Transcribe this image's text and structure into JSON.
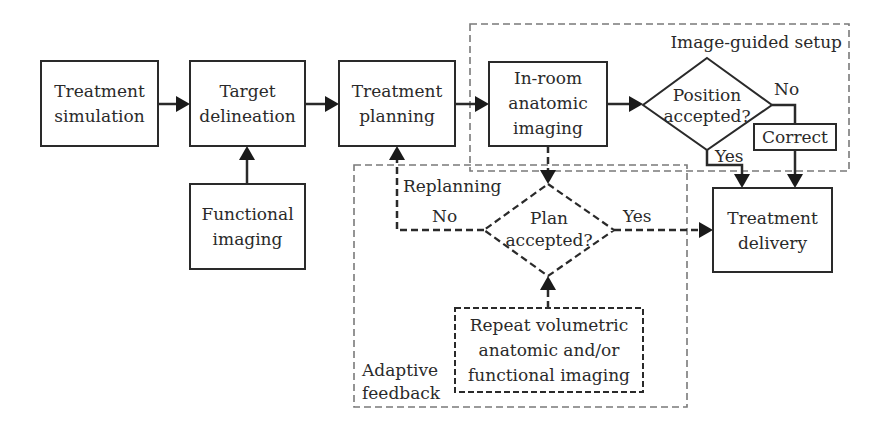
{
  "diagram": {
    "type": "flowchart",
    "nodes": {
      "treatment_simulation": {
        "line1": "Treatment",
        "line2": "simulation"
      },
      "target_delineation": {
        "line1": "Target",
        "line2": "delineation"
      },
      "functional_imaging": {
        "line1": "Functional",
        "line2": "imaging"
      },
      "treatment_planning": {
        "line1": "Treatment",
        "line2": "planning"
      },
      "inroom_imaging": {
        "line1": "In-room",
        "line2": "anatomic",
        "line3": "imaging"
      },
      "position_decision": {
        "line1": "Position",
        "line2": "accepted?"
      },
      "correct": {
        "label": "Correct"
      },
      "treatment_delivery": {
        "line1": "Treatment",
        "line2": "delivery"
      },
      "plan_decision": {
        "line1": "Plan",
        "line2": "accepted?"
      },
      "repeat_imaging": {
        "line1": "Repeat volumetric",
        "line2": "anatomic and/or",
        "line3": "functional imaging"
      }
    },
    "groups": {
      "image_guided_setup": {
        "label": "Image-guided setup"
      },
      "adaptive_feedback": {
        "line1": "Adaptive",
        "line2": "feedback"
      }
    },
    "edge_labels": {
      "position_no": "No",
      "position_yes": "Yes",
      "plan_no": "No",
      "plan_yes": "Yes",
      "replanning": "Replanning"
    },
    "edges": [
      {
        "from": "Treatment simulation",
        "to": "Target delineation",
        "style": "solid"
      },
      {
        "from": "Functional imaging",
        "to": "Target delineation",
        "style": "solid"
      },
      {
        "from": "Target delineation",
        "to": "Treatment planning",
        "style": "solid"
      },
      {
        "from": "Treatment planning",
        "to": "In-room anatomic imaging",
        "style": "solid"
      },
      {
        "from": "In-room anatomic imaging",
        "to": "Position accepted?",
        "style": "solid"
      },
      {
        "from": "Position accepted?",
        "to": "Correct",
        "label": "No",
        "style": "solid"
      },
      {
        "from": "Position accepted?",
        "to": "Treatment delivery",
        "label": "Yes",
        "style": "solid"
      },
      {
        "from": "Correct",
        "to": "Treatment delivery",
        "style": "solid"
      },
      {
        "from": "In-room anatomic imaging",
        "to": "Plan accepted?",
        "style": "dashed"
      },
      {
        "from": "Plan accepted?",
        "to": "Treatment planning",
        "label": "No",
        "style": "dashed"
      },
      {
        "from": "Plan accepted?",
        "to": "Treatment delivery",
        "label": "Yes",
        "style": "dashed"
      },
      {
        "from": "Repeat volumetric anatomic and/or functional imaging",
        "to": "Plan accepted?",
        "style": "dashed"
      }
    ]
  }
}
